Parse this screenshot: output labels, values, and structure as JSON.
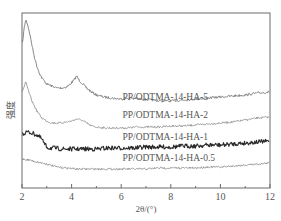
{
  "chart_data": {
    "type": "line",
    "title": "",
    "xlabel": "2θ/(°)",
    "ylabel": "强度",
    "xlim": [
      2,
      12
    ],
    "xticks": [
      2,
      4,
      6,
      8,
      10,
      12
    ],
    "xtick_labels": [
      "2",
      "4",
      "6",
      "8",
      "10",
      "12"
    ],
    "minor_xticks": [
      3,
      5,
      7,
      9,
      11
    ],
    "yticks": [],
    "grid": false,
    "legend": "inline labels above each curve",
    "y_units": "arbitrary (offset stacked, pixel-space)",
    "series": [
      {
        "name": "PP/ODTMA-14-HA-5",
        "color": "#7a7a7a",
        "stroke_width": 0.9,
        "noise": 1.2,
        "label_x": 6.05,
        "label_y": 100,
        "x": [
          2.0,
          2.05,
          2.1,
          2.15,
          2.2,
          2.3,
          2.4,
          2.5,
          2.6,
          2.7,
          2.8,
          3.0,
          3.2,
          3.4,
          3.6,
          3.8,
          3.95,
          4.1,
          4.2,
          4.3,
          4.45,
          4.6,
          4.8,
          5.0,
          5.3,
          5.6,
          6.0,
          6.4,
          6.8,
          7.2,
          7.6,
          8.0,
          8.5,
          9.0,
          9.5,
          10.0,
          10.5,
          11.0,
          11.5,
          12.0
        ],
        "y": [
          48,
          36,
          26,
          20,
          22,
          32,
          45,
          57,
          66,
          73,
          78,
          84,
          86,
          88,
          88,
          87,
          84,
          80,
          76,
          80,
          84,
          88,
          92,
          95,
          97,
          98,
          99,
          98,
          99,
          100,
          101,
          101,
          100,
          99,
          98,
          97,
          96,
          95,
          93,
          92
        ]
      },
      {
        "name": "PP/ODTMA-14-HA-2",
        "color": "#8a8a8a",
        "stroke_width": 0.8,
        "noise": 1.0,
        "label_x": 6.05,
        "label_y": 118,
        "x": [
          2.0,
          2.1,
          2.15,
          2.2,
          2.3,
          2.4,
          2.6,
          2.8,
          3.0,
          3.2,
          3.5,
          3.8,
          4.0,
          4.2,
          4.4,
          4.6,
          4.8,
          5.0,
          5.4,
          5.8,
          6.2,
          6.6,
          7.0,
          7.5,
          8.0,
          8.5,
          9.0,
          9.5,
          10.0,
          10.5,
          11.0,
          11.5,
          12.0
        ],
        "y": [
          92,
          86,
          82,
          86,
          94,
          101,
          111,
          118,
          121,
          123,
          123,
          122,
          121,
          119,
          120,
          123,
          126,
          127,
          128,
          128,
          128,
          127,
          127,
          127,
          126,
          126,
          125,
          124,
          123,
          122,
          120,
          118,
          117
        ]
      },
      {
        "name": "PP/ODTMA-14-HA-1",
        "color": "#2a2a2a",
        "stroke_width": 1.1,
        "noise": 2.2,
        "label_x": 6.05,
        "label_y": 140,
        "x": [
          2.0,
          2.2,
          2.4,
          2.6,
          2.8,
          2.9,
          3.0,
          3.1,
          3.3,
          3.6,
          4.0,
          4.5,
          5.0,
          5.5,
          6.0,
          6.5,
          7.0,
          7.5,
          8.0,
          8.5,
          9.0,
          9.5,
          10.0,
          10.5,
          11.0,
          11.5,
          12.0
        ],
        "y": [
          134,
          132,
          133,
          135,
          139,
          144,
          147,
          148,
          148,
          149,
          149,
          149,
          149,
          148,
          148,
          148,
          147,
          147,
          147,
          146,
          146,
          145,
          145,
          144,
          143,
          142,
          141
        ]
      },
      {
        "name": "PP/ODTMA-14-HA-0.5",
        "color": "#8a8a8a",
        "stroke_width": 0.8,
        "noise": 1.0,
        "label_x": 6.05,
        "label_y": 161,
        "x": [
          2.0,
          2.3,
          2.6,
          3.0,
          3.4,
          3.8,
          4.2,
          4.6,
          5.0,
          5.5,
          6.0,
          6.5,
          7.0,
          7.5,
          8.0,
          8.5,
          9.0,
          9.5,
          10.0,
          10.5,
          11.0,
          11.5,
          12.0
        ],
        "y": [
          159,
          160,
          162,
          164,
          167,
          168,
          169,
          169,
          169,
          169,
          169,
          169,
          169,
          168,
          168,
          168,
          168,
          167,
          167,
          166,
          165,
          164,
          163
        ]
      }
    ]
  },
  "axes": {
    "xlabel": "2θ/(°)",
    "ylabel": "强度"
  }
}
